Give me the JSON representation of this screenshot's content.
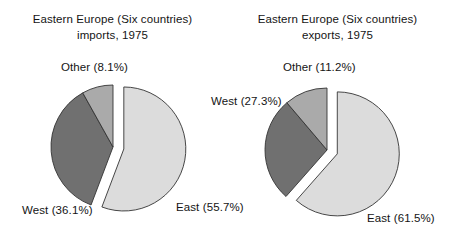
{
  "figure": {
    "background_color": "#ffffff",
    "text_color": "#141414"
  },
  "charts": [
    {
      "id": "imports",
      "title_line1": "Eastern Europe (Six countries)",
      "title_line2": "imports, 1975",
      "labels": {
        "other": "Other (8.1%)",
        "west": "West (36.1%)",
        "east": "East (55.7%)"
      }
    },
    {
      "id": "exports",
      "title_line1": "Eastern Europe (Six countries)",
      "title_line2": "exports, 1975",
      "labels": {
        "other": "Other (11.2%)",
        "west": "West (27.3%)",
        "east": "East (61.5%)"
      }
    }
  ],
  "chart_data": [
    {
      "type": "pie",
      "id": "imports",
      "title": "Eastern Europe (Six countries) imports, 1975",
      "categories": [
        "East",
        "West",
        "Other"
      ],
      "values": [
        55.7,
        36.1,
        8.1
      ],
      "value_unit": "percent",
      "labels": [
        "East (55.7%)",
        "West (36.1%)",
        "Other (8.1%)"
      ],
      "colors": [
        "#dcdcdc",
        "#707070",
        "#aaaaaa"
      ],
      "exploded": [
        "East"
      ],
      "explode_offset_px": 11,
      "start_angle_deg": -90,
      "direction": "clockwise",
      "center_px": [
        113,
        147
      ],
      "radius_px": 62,
      "edge_color": "#333333",
      "legend": "none",
      "grid": false
    },
    {
      "type": "pie",
      "id": "exports",
      "title": "Eastern Europe (Six countries) exports, 1975",
      "categories": [
        "East",
        "West",
        "Other"
      ],
      "values": [
        61.5,
        27.3,
        11.2
      ],
      "value_unit": "percent",
      "labels": [
        "East (61.5%)",
        "West (27.3%)",
        "Other (11.2%)"
      ],
      "colors": [
        "#dcdcdc",
        "#707070",
        "#aaaaaa"
      ],
      "exploded": [
        "East"
      ],
      "explode_offset_px": 11,
      "start_angle_deg": -90,
      "direction": "clockwise",
      "center_px": [
        327,
        150
      ],
      "radius_px": 62,
      "edge_color": "#333333",
      "legend": "none",
      "grid": false
    }
  ]
}
